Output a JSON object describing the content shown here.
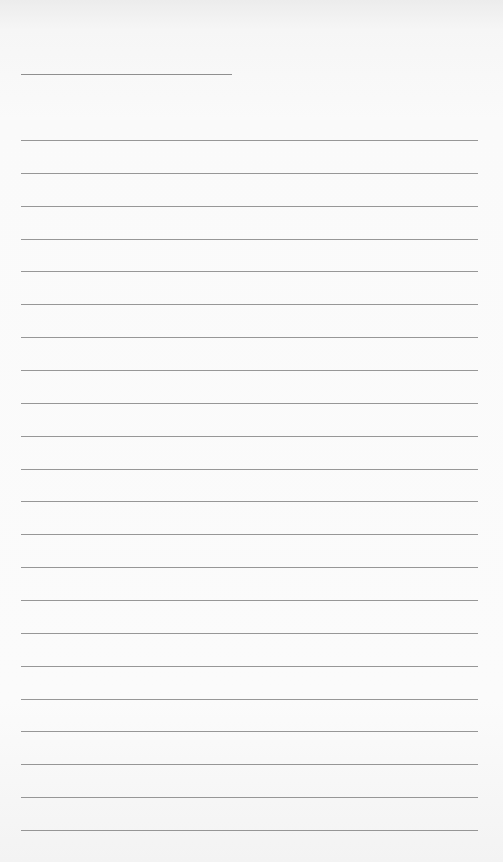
{
  "page": {
    "type": "blank-lined-paper",
    "background": "#fafafa",
    "rule_color": "#858585",
    "header_line": {
      "label": ""
    },
    "lines": [
      {
        "value": ""
      },
      {
        "value": ""
      },
      {
        "value": ""
      },
      {
        "value": ""
      },
      {
        "value": ""
      },
      {
        "value": ""
      },
      {
        "value": ""
      },
      {
        "value": ""
      },
      {
        "value": ""
      },
      {
        "value": ""
      },
      {
        "value": ""
      },
      {
        "value": ""
      },
      {
        "value": ""
      },
      {
        "value": ""
      },
      {
        "value": ""
      },
      {
        "value": ""
      },
      {
        "value": ""
      },
      {
        "value": ""
      },
      {
        "value": ""
      },
      {
        "value": ""
      },
      {
        "value": ""
      },
      {
        "value": ""
      }
    ]
  }
}
